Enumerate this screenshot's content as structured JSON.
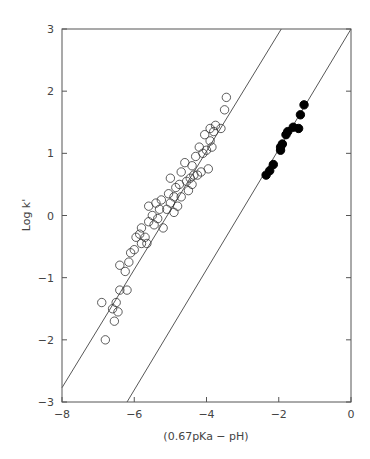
{
  "chart_data": {
    "type": "scatter",
    "title": "",
    "xlabel": "(0.67pKa − pH)",
    "ylabel": "Log k'",
    "xlim": [
      -8,
      0
    ],
    "ylim": [
      -3,
      3
    ],
    "xticks": [
      -8,
      -6,
      -4,
      -2,
      0
    ],
    "yticks": [
      -3,
      -2,
      -1,
      0,
      1,
      2,
      3
    ],
    "xtick_labels": [
      "−8",
      "−6",
      "−4",
      "−2",
      "0"
    ],
    "ytick_labels": [
      "−3",
      "−2",
      "−1",
      "0",
      "1",
      "2",
      "3"
    ],
    "grid": false,
    "legend": null,
    "series": [
      {
        "name": "open circles",
        "marker": "open-circle",
        "points": [
          [
            -6.9,
            -1.4
          ],
          [
            -6.8,
            -2.0
          ],
          [
            -6.6,
            -1.5
          ],
          [
            -6.55,
            -1.7
          ],
          [
            -6.5,
            -1.4
          ],
          [
            -6.45,
            -1.55
          ],
          [
            -6.4,
            -1.2
          ],
          [
            -6.4,
            -0.8
          ],
          [
            -6.25,
            -0.9
          ],
          [
            -6.2,
            -1.2
          ],
          [
            -6.15,
            -0.75
          ],
          [
            -6.1,
            -0.6
          ],
          [
            -6.0,
            -0.55
          ],
          [
            -5.95,
            -0.35
          ],
          [
            -5.85,
            -0.3
          ],
          [
            -5.8,
            -0.45
          ],
          [
            -5.8,
            -0.2
          ],
          [
            -5.7,
            -0.35
          ],
          [
            -5.65,
            -0.45
          ],
          [
            -5.6,
            -0.1
          ],
          [
            -5.6,
            0.15
          ],
          [
            -5.5,
            0.0
          ],
          [
            -5.45,
            -0.15
          ],
          [
            -5.4,
            0.2
          ],
          [
            -5.35,
            -0.05
          ],
          [
            -5.3,
            0.1
          ],
          [
            -5.25,
            0.25
          ],
          [
            -5.2,
            -0.2
          ],
          [
            -5.1,
            0.1
          ],
          [
            -5.05,
            0.35
          ],
          [
            -5.0,
            0.6
          ],
          [
            -5.0,
            0.2
          ],
          [
            -4.9,
            0.3
          ],
          [
            -4.9,
            0.05
          ],
          [
            -4.85,
            0.45
          ],
          [
            -4.8,
            0.15
          ],
          [
            -4.75,
            0.5
          ],
          [
            -4.7,
            0.7
          ],
          [
            -4.7,
            0.3
          ],
          [
            -4.6,
            0.85
          ],
          [
            -4.55,
            0.55
          ],
          [
            -4.5,
            0.4
          ],
          [
            -4.45,
            0.6
          ],
          [
            -4.4,
            0.8
          ],
          [
            -4.4,
            0.5
          ],
          [
            -4.35,
            0.65
          ],
          [
            -4.3,
            0.95
          ],
          [
            -4.25,
            0.65
          ],
          [
            -4.2,
            1.1
          ],
          [
            -4.15,
            0.7
          ],
          [
            -4.1,
            1.0
          ],
          [
            -4.05,
            1.3
          ],
          [
            -4.0,
            1.05
          ],
          [
            -3.95,
            0.75
          ],
          [
            -3.9,
            1.2
          ],
          [
            -3.9,
            1.4
          ],
          [
            -3.85,
            1.1
          ],
          [
            -3.8,
            1.35
          ],
          [
            -3.75,
            1.45
          ],
          [
            -3.6,
            1.4
          ],
          [
            -3.5,
            1.7
          ],
          [
            -3.45,
            1.9
          ]
        ]
      },
      {
        "name": "filled circles",
        "marker": "filled-circle",
        "points": [
          [
            -2.35,
            0.65
          ],
          [
            -2.25,
            0.72
          ],
          [
            -2.15,
            0.82
          ],
          [
            -1.95,
            1.05
          ],
          [
            -1.95,
            1.1
          ],
          [
            -1.9,
            1.15
          ],
          [
            -1.8,
            1.3
          ],
          [
            -1.75,
            1.35
          ],
          [
            -1.6,
            1.42
          ],
          [
            -1.45,
            1.4
          ],
          [
            -1.4,
            1.62
          ],
          [
            -1.3,
            1.78
          ]
        ]
      }
    ],
    "lines": [
      {
        "name": "fit open",
        "x": [
          -8.0,
          -1.93
        ],
        "y": [
          -2.77,
          3.0
        ]
      },
      {
        "name": "fit filled",
        "x": [
          -6.2,
          0.0
        ],
        "y": [
          -3.0,
          3.0
        ]
      }
    ]
  }
}
